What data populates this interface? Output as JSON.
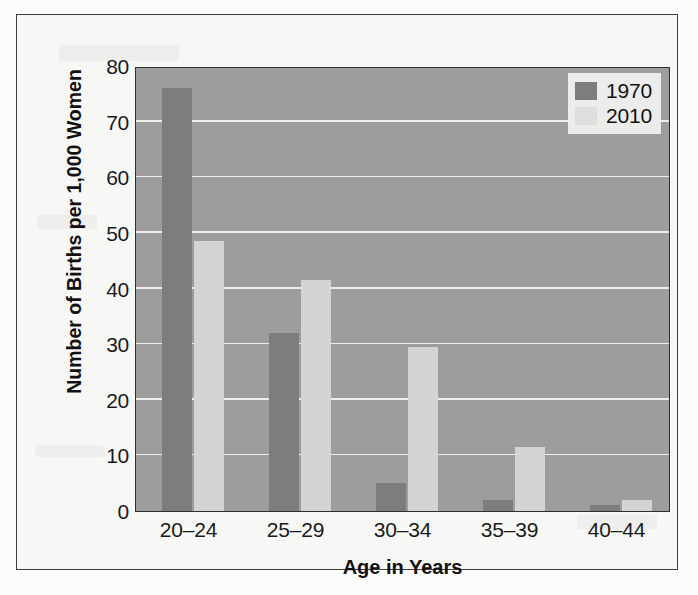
{
  "chart_data": {
    "type": "bar",
    "title": "",
    "xlabel": "Age in Years",
    "ylabel": "Number of Births per 1,000 Women",
    "categories": [
      "20–24",
      "25–29",
      "30–34",
      "35–39",
      "40–44"
    ],
    "series": [
      {
        "name": "1970",
        "color": "#7d7d7d",
        "values": [
          76,
          32,
          5,
          2,
          1
        ]
      },
      {
        "name": "2010",
        "color": "#d4d4d2",
        "values": [
          48.5,
          41.5,
          29.5,
          11.5,
          2
        ]
      }
    ],
    "ylim": [
      0,
      80
    ],
    "yticks": [
      0,
      10,
      20,
      30,
      40,
      50,
      60,
      70,
      80
    ],
    "ytick_labels": [
      "0",
      "10",
      "20",
      "30",
      "40",
      "50",
      "60",
      "70",
      "80"
    ],
    "grid": true,
    "grid_axis": "y",
    "legend_position": "top-right",
    "legend_entries": [
      "1970",
      "2010"
    ],
    "plot_background": "#9d9d9d",
    "gridline_color": "#f2f2f0",
    "figure_background": "#f7f7f5"
  }
}
